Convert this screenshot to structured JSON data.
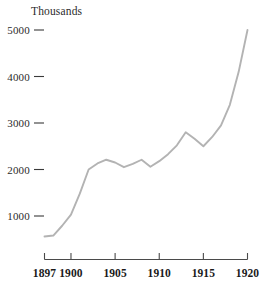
{
  "chart_data": {
    "type": "line",
    "title": "Thousands",
    "subtitle": "",
    "xlabel": "",
    "ylabel": "Thousands",
    "grid": false,
    "legend": false,
    "legend_position": "none",
    "line_color": "#b3b3b3",
    "axis_color": "#4a4a4a",
    "text_color": "#2b2b2b",
    "background_color": "#ffffff",
    "xlim": [
      1897,
      1920
    ],
    "ylim": [
      0,
      5200
    ],
    "ytick_values": [
      1000,
      2000,
      3000,
      4000,
      5000
    ],
    "ytick_labels": [
      "1000",
      "2000",
      "3000",
      "4000",
      "5000"
    ],
    "xtick_values": [
      1897,
      1900,
      1905,
      1910,
      1915,
      1920
    ],
    "xtick_labels": [
      "1897",
      "1900",
      "1905",
      "1910",
      "1915",
      "1920"
    ],
    "x": [
      1897,
      1898,
      1899,
      1900,
      1901,
      1902,
      1903,
      1904,
      1905,
      1906,
      1907,
      1908,
      1909,
      1910,
      1911,
      1912,
      1913,
      1914,
      1915,
      1916,
      1917,
      1918,
      1919,
      1920
    ],
    "values": [
      560,
      580,
      790,
      1030,
      1480,
      2000,
      2130,
      2210,
      2150,
      2050,
      2120,
      2210,
      2060,
      2180,
      2330,
      2520,
      2800,
      2660,
      2500,
      2700,
      2950,
      3390,
      4100,
      5000
    ],
    "series": [
      {
        "name": "Thousands",
        "color": "#b3b3b3",
        "values": [
          560,
          580,
          790,
          1030,
          1480,
          2000,
          2130,
          2210,
          2150,
          2050,
          2120,
          2210,
          2060,
          2180,
          2330,
          2520,
          2800,
          2660,
          2500,
          2700,
          2950,
          3390,
          4100,
          5000
        ]
      }
    ],
    "annotations": []
  }
}
